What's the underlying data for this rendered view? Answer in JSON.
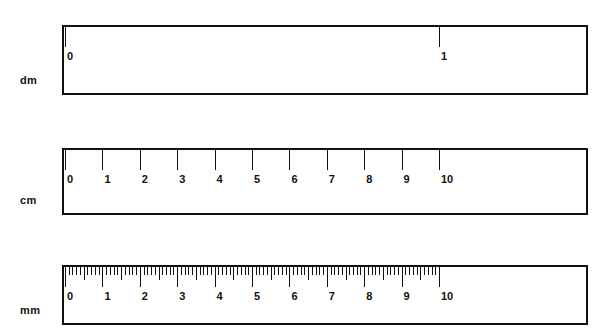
{
  "figure": {
    "title": "",
    "background_color": "#ffffff",
    "line_color": "#111111",
    "rulers": [
      {
        "id": "dm-ruler",
        "unit_label": "dm",
        "unit_name": "decimeter",
        "tick_labels": [
          "0",
          "1"
        ],
        "tick_values": [
          0,
          1
        ],
        "max_value": 1,
        "subdivisions_per_unit": 1,
        "has_minor_ticks": false,
        "has_mid_ticks": false
      },
      {
        "id": "cm-ruler",
        "unit_label": "cm",
        "unit_name": "centimeter",
        "tick_labels": [
          "0",
          "1",
          "2",
          "3",
          "4",
          "5",
          "6",
          "7",
          "8",
          "9",
          "10"
        ],
        "tick_values": [
          0,
          1,
          2,
          3,
          4,
          5,
          6,
          7,
          8,
          9,
          10
        ],
        "max_value": 10,
        "subdivisions_per_unit": 1,
        "has_minor_ticks": false,
        "has_mid_ticks": false
      },
      {
        "id": "mm-ruler",
        "unit_label": "mm",
        "unit_name": "millimeter",
        "tick_labels": [
          "0",
          "1",
          "2",
          "3",
          "4",
          "5",
          "6",
          "7",
          "8",
          "9",
          "10"
        ],
        "tick_values": [
          0,
          1,
          2,
          3,
          4,
          5,
          6,
          7,
          8,
          9,
          10
        ],
        "max_value": 10,
        "subdivisions_per_unit": 10,
        "has_minor_ticks": true,
        "has_mid_ticks": true
      }
    ]
  },
  "layout": {
    "scale_origin_x": 63,
    "scale_span_px": 374,
    "body_left": 62,
    "body_right": 588,
    "rows": [
      {
        "body_top": 25,
        "body_height": 70,
        "label_top": 74
      },
      {
        "body_top": 148,
        "body_height": 67,
        "label_top": 194
      },
      {
        "body_top": 265,
        "body_height": 60,
        "label_top": 304
      }
    ]
  }
}
